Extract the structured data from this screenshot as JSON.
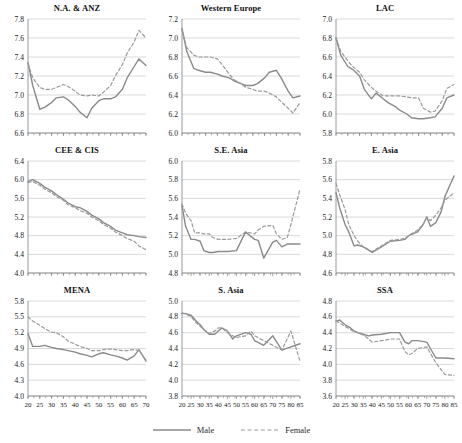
{
  "figure": {
    "title": "",
    "panel_order": [
      "na_anz",
      "western_europe",
      "lac",
      "cee_cis",
      "se_asia",
      "e_asia",
      "mena",
      "s_asia",
      "ssa"
    ]
  },
  "legend": {
    "position": "bottom-center",
    "items": [
      {
        "label": "Male",
        "style": "solid",
        "color": "#8a8a8a",
        "icon": "solid-line-swatch"
      },
      {
        "label": "Female",
        "style": "dashed",
        "color": "#9a9a9a",
        "icon": "dashed-line-swatch"
      }
    ]
  },
  "style": {
    "male_color": "#8a8a8a",
    "female_color": "#9a9a9a",
    "grid_color": "#c8c8c8",
    "axis_color": "#808080",
    "text_color": "#1a1a1a",
    "background": "#ffffff"
  },
  "chart_data": [
    {
      "id": "na_anz",
      "type": "line",
      "title": "N.A. & ANZ",
      "xlabel": "",
      "ylabel": "",
      "xlim": [
        20,
        70
      ],
      "ylim": [
        6.6,
        7.8
      ],
      "yticks": [
        6.6,
        6.8,
        7.0,
        7.2,
        7.4,
        7.6,
        7.8
      ],
      "ytick_labels": [
        "6.6",
        "6.8",
        "7.0",
        "7.2",
        "7.4",
        "7.6",
        "7.8"
      ],
      "xticks": [
        20,
        25,
        30,
        35,
        40,
        45,
        50,
        55,
        60,
        65,
        70
      ],
      "xtick_labels": [],
      "grid": "horizontal",
      "x": [
        20,
        22,
        25,
        27,
        30,
        32,
        35,
        37,
        40,
        42,
        45,
        47,
        50,
        52,
        55,
        57,
        60,
        62,
        65,
        67,
        70
      ],
      "series": [
        {
          "name": "Male",
          "style": "solid",
          "values": [
            7.34,
            7.1,
            6.85,
            6.87,
            6.92,
            6.97,
            6.98,
            6.95,
            6.88,
            6.82,
            6.76,
            6.86,
            6.94,
            6.96,
            6.96,
            6.98,
            7.06,
            7.18,
            7.3,
            7.38,
            7.31
          ]
        },
        {
          "name": "Female",
          "style": "dashed",
          "values": [
            7.33,
            7.18,
            7.08,
            7.06,
            7.06,
            7.08,
            7.11,
            7.09,
            7.04,
            7.0,
            6.99,
            7.0,
            6.99,
            7.03,
            7.1,
            7.2,
            7.32,
            7.44,
            7.56,
            7.68,
            7.6
          ]
        }
      ]
    },
    {
      "id": "western_europe",
      "type": "line",
      "title": "Western Europe",
      "xlabel": "",
      "ylabel": "",
      "xlim": [
        20,
        70
      ],
      "ylim": [
        6.0,
        7.2
      ],
      "yticks": [
        6.0,
        6.2,
        6.4,
        6.6,
        6.8,
        7.0,
        7.2
      ],
      "ytick_labels": [
        "6.0",
        "6.2",
        "6.4",
        "6.6",
        "6.8",
        "7.0",
        "7.2"
      ],
      "xticks": [
        20,
        25,
        30,
        35,
        40,
        45,
        50,
        55,
        60,
        65,
        70
      ],
      "xtick_labels": [],
      "grid": "horizontal",
      "x": [
        20,
        22,
        25,
        27,
        30,
        32,
        35,
        37,
        40,
        42,
        45,
        47,
        50,
        52,
        55,
        57,
        60,
        62,
        65,
        67,
        70
      ],
      "series": [
        {
          "name": "Male",
          "style": "solid",
          "values": [
            7.1,
            6.86,
            6.68,
            6.66,
            6.64,
            6.64,
            6.62,
            6.6,
            6.58,
            6.55,
            6.52,
            6.5,
            6.5,
            6.52,
            6.58,
            6.64,
            6.66,
            6.58,
            6.44,
            6.37,
            6.39
          ]
        },
        {
          "name": "Female",
          "style": "dashed",
          "values": [
            7.08,
            6.9,
            6.82,
            6.8,
            6.8,
            6.8,
            6.78,
            6.72,
            6.62,
            6.56,
            6.52,
            6.48,
            6.46,
            6.44,
            6.44,
            6.42,
            6.38,
            6.33,
            6.26,
            6.21,
            6.32
          ]
        }
      ]
    },
    {
      "id": "lac",
      "type": "line",
      "title": "LAC",
      "xlabel": "",
      "ylabel": "",
      "xlim": [
        20,
        70
      ],
      "ylim": [
        5.8,
        7.0
      ],
      "yticks": [
        5.8,
        6.0,
        6.2,
        6.4,
        6.6,
        6.8,
        7.0
      ],
      "ytick_labels": [
        "5.8",
        "6.0",
        "6.2",
        "6.4",
        "6.6",
        "6.8",
        "7.0"
      ],
      "xticks": [
        20,
        25,
        30,
        35,
        40,
        45,
        50,
        55,
        60,
        65,
        70
      ],
      "xtick_labels": [],
      "grid": "horizontal",
      "x": [
        20,
        22,
        25,
        27,
        30,
        32,
        35,
        37,
        40,
        42,
        45,
        47,
        50,
        52,
        55,
        57,
        60,
        62,
        65,
        67,
        70
      ],
      "series": [
        {
          "name": "Male",
          "style": "solid",
          "values": [
            6.8,
            6.62,
            6.5,
            6.47,
            6.4,
            6.26,
            6.16,
            6.22,
            6.16,
            6.12,
            6.08,
            6.04,
            6.0,
            5.96,
            5.95,
            5.95,
            5.96,
            5.97,
            6.06,
            6.17,
            6.2
          ]
        },
        {
          "name": "Female",
          "style": "dashed",
          "values": [
            6.8,
            6.66,
            6.56,
            6.5,
            6.44,
            6.36,
            6.28,
            6.24,
            6.19,
            6.19,
            6.19,
            6.19,
            6.18,
            6.17,
            6.17,
            6.06,
            6.02,
            6.03,
            6.14,
            6.27,
            6.31
          ]
        }
      ]
    },
    {
      "id": "cee_cis",
      "type": "line",
      "title": "CEE & CIS",
      "xlabel": "",
      "ylabel": "",
      "xlim": [
        20,
        70
      ],
      "ylim": [
        4.0,
        6.4
      ],
      "yticks": [
        4.0,
        4.4,
        4.8,
        5.2,
        5.6,
        6.0,
        6.4
      ],
      "ytick_labels": [
        "4.0",
        "4.4",
        "4.8",
        "5.2",
        "5.6",
        "6.0",
        "6.4"
      ],
      "xticks": [
        20,
        25,
        30,
        35,
        40,
        45,
        50,
        55,
        60,
        65,
        70
      ],
      "xtick_labels": [],
      "grid": "horizontal",
      "x": [
        20,
        22,
        25,
        27,
        30,
        32,
        35,
        37,
        40,
        42,
        45,
        47,
        50,
        52,
        55,
        57,
        60,
        62,
        65,
        67,
        70
      ],
      "series": [
        {
          "name": "Male",
          "style": "solid",
          "values": [
            5.96,
            6.0,
            5.92,
            5.84,
            5.76,
            5.68,
            5.58,
            5.5,
            5.42,
            5.4,
            5.32,
            5.24,
            5.16,
            5.08,
            5.0,
            4.92,
            4.86,
            4.82,
            4.8,
            4.78,
            4.76
          ]
        },
        {
          "name": "Female",
          "style": "dashed",
          "values": [
            5.94,
            5.96,
            5.88,
            5.8,
            5.72,
            5.64,
            5.56,
            5.46,
            5.4,
            5.34,
            5.28,
            5.2,
            5.12,
            5.04,
            4.96,
            4.88,
            4.8,
            4.74,
            4.68,
            4.58,
            4.5
          ]
        }
      ]
    },
    {
      "id": "se_asia",
      "type": "line",
      "title": "S.E. Asia",
      "xlabel": "",
      "ylabel": "",
      "xlim": [
        20,
        85
      ],
      "ylim": [
        4.8,
        6.0
      ],
      "yticks": [
        4.8,
        5.0,
        5.2,
        5.4,
        5.6,
        5.8,
        6.0
      ],
      "ytick_labels": [
        "4.8",
        "5.0",
        "5.2",
        "5.4",
        "5.6",
        "5.8",
        "6.0"
      ],
      "xticks": [
        20,
        25,
        30,
        35,
        40,
        45,
        50,
        55,
        60,
        65,
        70,
        75,
        80,
        85
      ],
      "xtick_labels": [],
      "grid": "horizontal",
      "x": [
        20,
        22,
        25,
        27,
        30,
        32,
        35,
        37,
        40,
        45,
        50,
        55,
        60,
        62,
        65,
        70,
        72,
        75,
        78,
        80,
        85
      ],
      "series": [
        {
          "name": "Male",
          "style": "solid",
          "values": [
            5.52,
            5.3,
            5.16,
            5.16,
            5.14,
            5.04,
            5.02,
            5.02,
            5.03,
            5.03,
            5.04,
            5.24,
            5.16,
            5.15,
            4.96,
            5.13,
            5.15,
            5.08,
            5.11,
            5.11,
            5.11
          ]
        },
        {
          "name": "Female",
          "style": "dashed",
          "values": [
            5.54,
            5.44,
            5.36,
            5.23,
            5.23,
            5.22,
            5.22,
            5.18,
            5.16,
            5.16,
            5.17,
            5.24,
            5.22,
            5.26,
            5.3,
            5.31,
            5.22,
            5.16,
            5.18,
            5.32,
            5.7
          ]
        }
      ]
    },
    {
      "id": "e_asia",
      "type": "line",
      "title": "E. Asia",
      "xlabel": "",
      "ylabel": "",
      "xlim": [
        20,
        85
      ],
      "ylim": [
        4.6,
        5.8
      ],
      "yticks": [
        4.6,
        4.8,
        5.0,
        5.2,
        5.4,
        5.6,
        5.8
      ],
      "ytick_labels": [
        "4.6",
        "4.8",
        "5.0",
        "5.2",
        "5.4",
        "5.6",
        "5.8"
      ],
      "xticks": [
        20,
        25,
        30,
        35,
        40,
        45,
        50,
        55,
        60,
        65,
        70,
        75,
        80,
        85
      ],
      "xtick_labels": [],
      "grid": "horizontal",
      "x": [
        20,
        22,
        25,
        27,
        30,
        32,
        35,
        40,
        45,
        50,
        55,
        58,
        60,
        65,
        68,
        70,
        72,
        75,
        78,
        80,
        85
      ],
      "series": [
        {
          "name": "Male",
          "style": "solid",
          "values": [
            5.46,
            5.3,
            5.12,
            5.04,
            4.89,
            4.9,
            4.88,
            4.82,
            4.88,
            4.94,
            4.95,
            4.96,
            5.0,
            5.04,
            5.12,
            5.2,
            5.1,
            5.14,
            5.26,
            5.42,
            5.64
          ]
        },
        {
          "name": "Female",
          "style": "dashed",
          "values": [
            5.56,
            5.44,
            5.28,
            5.12,
            5.0,
            4.94,
            4.88,
            4.83,
            4.89,
            4.95,
            4.96,
            4.97,
            5.0,
            5.06,
            5.12,
            5.2,
            5.16,
            5.22,
            5.3,
            5.38,
            5.46
          ]
        }
      ]
    },
    {
      "id": "mena",
      "type": "line",
      "title": "MENA",
      "xlabel": "",
      "ylabel": "",
      "xlim": [
        20,
        70
      ],
      "ylim": [
        4.0,
        5.8
      ],
      "yticks": [
        4.0,
        4.3,
        4.6,
        4.9,
        5.2,
        5.5,
        5.8
      ],
      "ytick_labels": [
        "4.0",
        "4.3",
        "4.6",
        "4.9",
        "5.2",
        "5.5",
        "5.8"
      ],
      "xticks": [
        20,
        25,
        30,
        35,
        40,
        45,
        50,
        55,
        60,
        65,
        70
      ],
      "xtick_labels": [
        "20",
        "25",
        "30",
        "35",
        "40",
        "45",
        "50",
        "55",
        "60",
        "65",
        "70"
      ],
      "grid": "horizontal",
      "x": [
        20,
        22,
        25,
        27,
        30,
        32,
        35,
        37,
        40,
        42,
        45,
        47,
        50,
        52,
        55,
        57,
        60,
        62,
        65,
        67,
        70
      ],
      "series": [
        {
          "name": "Male",
          "style": "solid",
          "values": [
            5.18,
            4.94,
            4.94,
            4.96,
            4.92,
            4.9,
            4.88,
            4.86,
            4.83,
            4.8,
            4.77,
            4.74,
            4.8,
            4.82,
            4.78,
            4.76,
            4.72,
            4.68,
            4.76,
            4.88,
            4.66
          ]
        },
        {
          "name": "Female",
          "style": "dashed",
          "values": [
            5.5,
            5.42,
            5.34,
            5.28,
            5.21,
            5.2,
            5.12,
            5.04,
            4.98,
            4.94,
            4.9,
            4.86,
            4.86,
            4.88,
            4.89,
            4.88,
            4.86,
            4.86,
            4.88,
            4.86,
            4.68
          ]
        }
      ]
    },
    {
      "id": "s_asia",
      "type": "line",
      "title": "S. Asia",
      "xlabel": "",
      "ylabel": "",
      "xlim": [
        20,
        85
      ],
      "ylim": [
        3.8,
        5.0
      ],
      "yticks": [
        3.8,
        4.0,
        4.2,
        4.4,
        4.6,
        4.8,
        5.0
      ],
      "ytick_labels": [
        "3.8",
        "4.0",
        "4.2",
        "4.4",
        "4.6",
        "4.8",
        "5.0"
      ],
      "xticks": [
        20,
        25,
        30,
        35,
        40,
        45,
        50,
        55,
        60,
        65,
        70,
        75,
        80,
        85
      ],
      "xtick_labels": [
        "20",
        "25",
        "30",
        "35",
        "40",
        "45",
        "50",
        "55",
        "60",
        "65",
        "70",
        "75",
        "80",
        "85"
      ],
      "grid": "horizontal",
      "x": [
        20,
        22,
        25,
        28,
        30,
        32,
        35,
        38,
        40,
        42,
        45,
        48,
        50,
        55,
        58,
        60,
        65,
        70,
        75,
        80,
        85
      ],
      "series": [
        {
          "name": "Male",
          "style": "solid",
          "values": [
            4.84,
            4.84,
            4.82,
            4.74,
            4.7,
            4.64,
            4.58,
            4.58,
            4.62,
            4.66,
            4.62,
            4.52,
            4.56,
            4.6,
            4.58,
            4.5,
            4.44,
            4.56,
            4.38,
            4.42,
            4.46
          ]
        },
        {
          "name": "Female",
          "style": "dashed",
          "values": [
            4.85,
            4.84,
            4.8,
            4.72,
            4.68,
            4.64,
            4.59,
            4.62,
            4.66,
            4.66,
            4.6,
            4.56,
            4.54,
            4.56,
            4.62,
            4.56,
            4.5,
            4.44,
            4.38,
            4.62,
            4.24
          ]
        }
      ]
    },
    {
      "id": "ssa",
      "type": "line",
      "title": "SSA",
      "xlabel": "",
      "ylabel": "",
      "xlim": [
        20,
        85
      ],
      "ylim": [
        3.6,
        4.8
      ],
      "yticks": [
        3.6,
        3.8,
        4.0,
        4.2,
        4.4,
        4.6,
        4.8
      ],
      "ytick_labels": [
        "3.6",
        "3.8",
        "4.0",
        "4.2",
        "4.4",
        "4.6",
        "4.8"
      ],
      "xticks": [
        20,
        25,
        30,
        35,
        40,
        45,
        50,
        55,
        60,
        65,
        70,
        75,
        80,
        85
      ],
      "xtick_labels": [
        "20",
        "25",
        "30",
        "35",
        "40",
        "45",
        "50",
        "55",
        "60",
        "65",
        "70",
        "75",
        "80",
        "85"
      ],
      "grid": "horizontal",
      "x": [
        20,
        22,
        25,
        28,
        30,
        32,
        35,
        38,
        40,
        45,
        50,
        55,
        58,
        60,
        62,
        65,
        70,
        72,
        75,
        80,
        85
      ],
      "series": [
        {
          "name": "Male",
          "style": "solid",
          "values": [
            4.54,
            4.56,
            4.5,
            4.46,
            4.42,
            4.4,
            4.38,
            4.36,
            4.37,
            4.38,
            4.4,
            4.4,
            4.28,
            4.26,
            4.3,
            4.3,
            4.28,
            4.2,
            4.08,
            4.08,
            4.07
          ]
        },
        {
          "name": "Female",
          "style": "dashed",
          "values": [
            4.55,
            4.52,
            4.48,
            4.44,
            4.41,
            4.4,
            4.37,
            4.32,
            4.28,
            4.3,
            4.32,
            4.32,
            4.16,
            4.12,
            4.14,
            4.2,
            4.22,
            4.14,
            4.02,
            3.87,
            3.86
          ]
        }
      ]
    }
  ]
}
